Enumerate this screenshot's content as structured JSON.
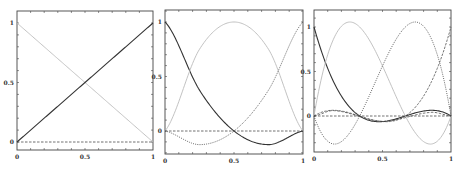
{
  "chart_data": [
    {
      "type": "line",
      "title": "",
      "xlabel": "",
      "ylabel": "",
      "xlim": [
        0,
        1
      ],
      "ylim": [
        -0.07,
        1.07
      ],
      "xticks": [
        "0",
        "0.5",
        "1"
      ],
      "yticks": [
        "0",
        "0.5",
        "1"
      ],
      "grid": false,
      "frame": {
        "left": 17,
        "right": 153,
        "top": 11,
        "bottom": 150,
        "y0_px": 142,
        "y1_px": 23
      },
      "series": [
        {
          "name": "phi_0 (1-x)",
          "style": "light",
          "x": [
            0,
            1
          ],
          "y": [
            1,
            0
          ]
        },
        {
          "name": "phi_1 (x)",
          "style": "solid",
          "x": [
            0,
            1
          ],
          "y": [
            0,
            1
          ]
        },
        {
          "name": "zero baseline",
          "style": "dashed",
          "x": [
            0,
            1
          ],
          "y": [
            0,
            0
          ]
        }
      ]
    },
    {
      "type": "line",
      "title": "",
      "xlabel": "",
      "ylabel": "",
      "xlim": [
        0,
        1
      ],
      "ylim": [
        -0.2,
        1.1
      ],
      "xticks": [
        "0",
        "0.5",
        "1"
      ],
      "yticks": [
        "0",
        "0.5",
        "1"
      ],
      "grid": false,
      "frame": {
        "left": 165,
        "right": 303,
        "top": 10,
        "bottom": 154,
        "y0_px": 131,
        "y1_px": 22
      },
      "series": [
        {
          "name": "phi_0 (2x-1)(x-1)",
          "style": "solid",
          "x": [
            0,
            0.25,
            0.5,
            0.75,
            1
          ],
          "y": [
            1,
            0.375,
            0,
            -0.125,
            0
          ]
        },
        {
          "name": "phi_1 4x(1-x)",
          "style": "light",
          "x": [
            0,
            0.25,
            0.5,
            0.75,
            1
          ],
          "y": [
            0,
            0.75,
            1,
            0.75,
            0
          ]
        },
        {
          "name": "phi_2 x(2x-1)",
          "style": "dotted",
          "x": [
            0,
            0.25,
            0.5,
            0.75,
            1
          ],
          "y": [
            0,
            -0.125,
            0,
            0.375,
            1
          ]
        },
        {
          "name": "zero baseline",
          "style": "dashed",
          "x": [
            0,
            1
          ],
          "y": [
            0,
            0
          ]
        }
      ]
    },
    {
      "type": "line",
      "title": "",
      "xlabel": "",
      "ylabel": "",
      "xlim": [
        0,
        1
      ],
      "ylim": [
        -0.4,
        1.2
      ],
      "xticks": [
        "0",
        "0.5",
        "1"
      ],
      "yticks": [
        "0",
        "0.5",
        "1"
      ],
      "grid": false,
      "frame": {
        "left": 314,
        "right": 451,
        "top": 10,
        "bottom": 152,
        "y0_px": 116,
        "y1_px": 27
      },
      "series": [
        {
          "name": "phi_0 cubic",
          "style": "solid",
          "nodes": [
            0,
            0.3333,
            0.6667,
            1
          ],
          "index": 0
        },
        {
          "name": "phi_1 cubic",
          "style": "light",
          "nodes": [
            0,
            0.3333,
            0.6667,
            1
          ],
          "index": 1
        },
        {
          "name": "phi_2 cubic",
          "style": "dotted",
          "nodes": [
            0,
            0.3333,
            0.6667,
            1
          ],
          "index": 2
        },
        {
          "name": "phi_3 cubic",
          "style": "dashdot",
          "nodes": [
            0,
            0.3333,
            0.6667,
            1
          ],
          "index": 3
        },
        {
          "name": "small dashed curve",
          "style": "dashed",
          "x": [
            0,
            0.15,
            0.5,
            0.85,
            1
          ],
          "y": [
            0,
            0.06,
            -0.06,
            0.04,
            0
          ]
        },
        {
          "name": "zero baseline",
          "style": "dashed",
          "x": [
            0,
            1
          ],
          "y": [
            0,
            0
          ]
        }
      ]
    }
  ],
  "styles": {
    "solid": {
      "stroke": "#333333",
      "width": 1.1,
      "dash": ""
    },
    "light": {
      "stroke": "#bbbbbb",
      "width": 0.9,
      "dash": ""
    },
    "dotted": {
      "stroke": "#555555",
      "width": 0.9,
      "dash": "1,1.2"
    },
    "dashdot": {
      "stroke": "#666666",
      "width": 0.9,
      "dash": "2.5,1.2"
    },
    "dashed": {
      "stroke": "#444444",
      "width": 0.8,
      "dash": "2.5,1.5"
    }
  },
  "frame_color": "#444444"
}
